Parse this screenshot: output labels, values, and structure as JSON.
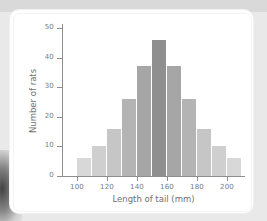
{
  "figure": {
    "background_color": "#e9e9e9",
    "card_color": "#ffffff"
  },
  "chart_data": {
    "type": "bar",
    "title": "",
    "subtitle": "",
    "xlabel": "Length of tail (mm)",
    "ylabel": "Number of rats",
    "grid": false,
    "legend": "none",
    "xlim": [
      90,
      212
    ],
    "ylim": [
      0,
      53
    ],
    "xticks": [
      100,
      120,
      140,
      160,
      180,
      200
    ],
    "xtick_labels": [
      "100",
      "120",
      "140",
      "160",
      "180",
      "200"
    ],
    "yticks": [
      0,
      10,
      20,
      30,
      40,
      50
    ],
    "ytick_labels": [
      "0",
      "10",
      "20",
      "30",
      "40",
      "50"
    ],
    "bin_width": 10,
    "bin_starts": [
      100,
      110,
      120,
      130,
      140,
      150,
      160,
      170,
      180,
      190,
      200
    ],
    "bin_labels": [
      "100-110",
      "110-120",
      "120-130",
      "130-140",
      "140-150",
      "150-160",
      "160-170",
      "170-180",
      "180-190",
      "190-200",
      "200-210"
    ],
    "categories": [
      "100-110",
      "110-120",
      "120-130",
      "130-140",
      "140-150",
      "150-160",
      "160-170",
      "170-180",
      "180-190",
      "190-200",
      "200-210"
    ],
    "values": [
      6,
      10,
      16,
      26,
      37,
      46,
      37,
      26,
      16,
      10,
      6
    ],
    "bar_colors": [
      "#d8d8d8",
      "#cfcfcf",
      "#c6c6c6",
      "#b4b4b4",
      "#a6a6a6",
      "#8f8f8f",
      "#a6a6a6",
      "#b4b4b4",
      "#c6c6c6",
      "#cfcfcf",
      "#d8d8d8"
    ],
    "axis_color": "#8e8e8e",
    "tick_label_color": "#7a7a7a",
    "axis_title_color": "#6f6f6f"
  }
}
